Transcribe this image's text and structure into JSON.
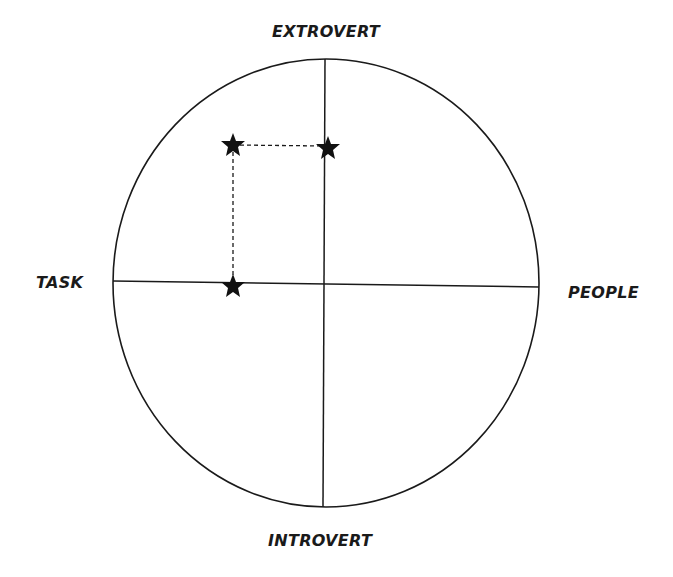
{
  "diagram": {
    "type": "quadrant-circle",
    "axes": {
      "top": "EXTROVERT",
      "bottom": "INTROVERT",
      "left": "TASK",
      "right": "PEOPLE"
    },
    "points": [
      {
        "id": "star-upper-left",
        "x": 233,
        "y": 145
      },
      {
        "id": "star-upper-axis",
        "x": 327,
        "y": 148
      },
      {
        "id": "star-left-axis",
        "x": 233,
        "y": 286
      }
    ],
    "connectors": [
      {
        "from": "star-upper-left",
        "to": "star-upper-axis",
        "style": "dashed"
      },
      {
        "from": "star-upper-left",
        "to": "star-left-axis",
        "style": "dashed"
      }
    ],
    "colors": {
      "line": "#1a1a1a",
      "background": "#ffffff"
    }
  }
}
